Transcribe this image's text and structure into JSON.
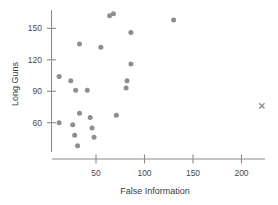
{
  "chart_data": {
    "type": "scatter",
    "title": "",
    "xlabel": "False Information",
    "ylabel": "Long Guns",
    "xlim": [
      0,
      230
    ],
    "ylim": [
      30,
      170
    ],
    "grid": false,
    "legend": null,
    "xticks": [
      50,
      100,
      150,
      200
    ],
    "yticks": [
      60,
      90,
      120,
      150
    ],
    "xtick_labels": [
      "50",
      "100",
      "150",
      "200"
    ],
    "ytick_labels": [
      "60",
      "90",
      "120",
      "150"
    ],
    "point_color": "#8e8e8e",
    "axis_color": "#8a8a8a",
    "text_color": "#3d3d3d",
    "points": [
      {
        "x": 64,
        "y": 162
      },
      {
        "x": 68,
        "y": 164
      },
      {
        "x": 86,
        "y": 146
      },
      {
        "x": 130,
        "y": 158
      },
      {
        "x": 33,
        "y": 135
      },
      {
        "x": 55,
        "y": 132
      },
      {
        "x": 86,
        "y": 116
      },
      {
        "x": 12,
        "y": 104
      },
      {
        "x": 24,
        "y": 100
      },
      {
        "x": 82,
        "y": 100
      },
      {
        "x": 29,
        "y": 91
      },
      {
        "x": 41,
        "y": 91
      },
      {
        "x": 81,
        "y": 93
      },
      {
        "x": 33,
        "y": 69
      },
      {
        "x": 44,
        "y": 65
      },
      {
        "x": 71,
        "y": 67
      },
      {
        "x": 12,
        "y": 60
      },
      {
        "x": 26,
        "y": 58
      },
      {
        "x": 46,
        "y": 55
      },
      {
        "x": 28,
        "y": 48
      },
      {
        "x": 48,
        "y": 46
      },
      {
        "x": 31,
        "y": 38
      }
    ],
    "x_markers": [
      {
        "x": 221,
        "y": 76
      }
    ]
  }
}
